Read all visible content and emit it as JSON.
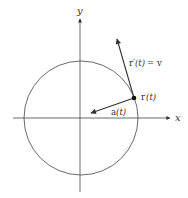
{
  "diagram": {
    "axes": {
      "x_label": "x",
      "y_label": "y"
    },
    "circle": {
      "center": [
        81,
        118
      ],
      "radius": 58
    },
    "point": {
      "label": "r (t)",
      "label_main": "r",
      "label_arg": "(t)"
    },
    "velocity": {
      "label": "r′(t) = v",
      "label_main": "r′",
      "label_arg": "(t)",
      "label_eq": "= v"
    },
    "acceleration": {
      "label": "a (t)",
      "label_main": "a",
      "label_arg": "(t)"
    },
    "colors": {
      "stroke": "#333333",
      "point": "#111111"
    }
  }
}
